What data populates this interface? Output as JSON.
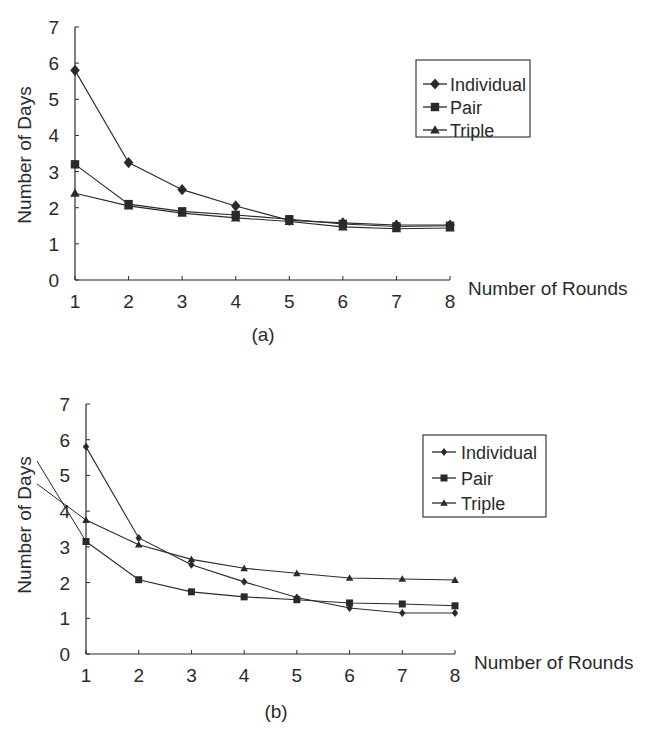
{
  "chart_data": [
    {
      "type": "line",
      "panel_label": "(a)",
      "title": "",
      "xlabel": "Number of Rounds",
      "ylabel": "Number of Days",
      "x": [
        1,
        2,
        3,
        4,
        5,
        6,
        7,
        8
      ],
      "xlim": [
        1,
        8
      ],
      "ylim": [
        0,
        7
      ],
      "x_ticks": [
        "1",
        "2",
        "3",
        "4",
        "5",
        "6",
        "7",
        "8"
      ],
      "y_ticks": [
        "0",
        "1",
        "2",
        "3",
        "4",
        "5",
        "6",
        "7"
      ],
      "grid": false,
      "legend_position": "upper right (boxed)",
      "series": [
        {
          "name": "Individual",
          "marker": "diamond",
          "values": [
            5.8,
            3.25,
            2.5,
            2.05,
            1.65,
            1.58,
            1.52,
            1.52
          ]
        },
        {
          "name": "Pair",
          "marker": "square",
          "values": [
            3.2,
            2.1,
            1.9,
            1.8,
            1.68,
            1.55,
            1.48,
            1.5
          ]
        },
        {
          "name": "Triple",
          "marker": "triangle",
          "values": [
            2.4,
            2.05,
            1.85,
            1.72,
            1.62,
            1.47,
            1.42,
            1.44
          ]
        }
      ]
    },
    {
      "type": "line",
      "panel_label": "(b)",
      "title": "",
      "xlabel": "Number of Rounds",
      "ylabel": "Number of Days",
      "x": [
        1,
        2,
        3,
        4,
        5,
        6,
        7,
        8
      ],
      "xlim": [
        1,
        8
      ],
      "ylim": [
        0,
        7
      ],
      "x_ticks": [
        "1",
        "2",
        "3",
        "4",
        "5",
        "6",
        "7",
        "8"
      ],
      "y_ticks": [
        "0",
        "1",
        "2",
        "3",
        "4",
        "5",
        "6",
        "7"
      ],
      "grid": false,
      "legend_position": "upper right (boxed)",
      "series": [
        {
          "name": "Individual",
          "marker": "small diamond",
          "values": [
            5.8,
            3.25,
            2.5,
            2.02,
            1.58,
            1.29,
            1.15,
            1.15
          ]
        },
        {
          "name": "Pair",
          "marker": "small square",
          "values": [
            3.15,
            2.08,
            1.74,
            1.6,
            1.52,
            1.43,
            1.4,
            1.35
          ]
        },
        {
          "name": "Triple",
          "marker": "small triangle",
          "values": [
            3.75,
            3.06,
            2.65,
            2.4,
            2.26,
            2.13,
            2.1,
            2.07
          ]
        }
      ]
    }
  ]
}
